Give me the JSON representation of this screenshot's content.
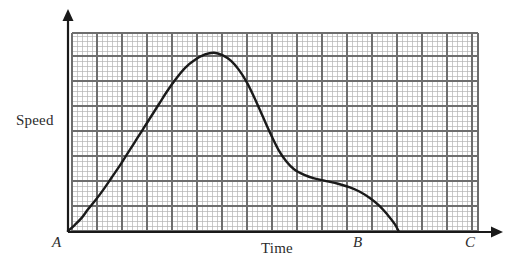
{
  "figure": {
    "kind": "speed-time-graph",
    "background_color": "#ffffff",
    "ink_color": "#1a1a1a"
  },
  "axes": {
    "x_axis_label": "Time",
    "y_axis_label": "Speed",
    "x_axis": {
      "start_x": 68,
      "end_x": 503,
      "y": 232,
      "arrow": true
    },
    "y_axis": {
      "x": 68,
      "top_y": 10,
      "bottom_y": 232,
      "arrow": true
    },
    "tick_labels": [
      {
        "name": "A",
        "text": "A",
        "x": 70,
        "y": 232
      },
      {
        "name": "B",
        "text": "B",
        "x": 360,
        "y": 232
      },
      {
        "name": "C",
        "text": "C",
        "x": 472,
        "y": 232
      }
    ]
  },
  "grid": {
    "left": 72,
    "top": 33,
    "right": 478,
    "bottom": 231,
    "minor_spacing": 5,
    "major_every": 5,
    "minor_color": "#b4b4b4",
    "major_color": "#6e6e6e"
  },
  "chart_data": {
    "type": "line",
    "title": "",
    "xlabel": "Time",
    "ylabel": "Speed",
    "grid": true,
    "legend": null,
    "x_tick_labels": [
      "A",
      "B",
      "C"
    ],
    "y_tick_labels": [],
    "annotations": [
      {
        "label": "A",
        "meaning": "origin / start of journey"
      },
      {
        "label": "B",
        "meaning": "speed returns to zero"
      },
      {
        "label": "C",
        "meaning": "end of time axis"
      }
    ],
    "series": [
      {
        "name": "Speed",
        "color": "#1a1a1a",
        "line_width": 2.4,
        "comment": "Speed rises from rest at A, peaks, falls to a plateau, then drops to rest at B.",
        "points": [
          {
            "x": 0.0,
            "y": 0.0
          },
          {
            "x": 0.035,
            "y": 0.035
          },
          {
            "x": 0.07,
            "y": 0.075
          },
          {
            "x": 0.1,
            "y": 0.12
          },
          {
            "x": 0.14,
            "y": 0.175
          },
          {
            "x": 0.18,
            "y": 0.235
          },
          {
            "x": 0.22,
            "y": 0.3
          },
          {
            "x": 0.26,
            "y": 0.365
          },
          {
            "x": 0.3,
            "y": 0.435
          },
          {
            "x": 0.34,
            "y": 0.505
          },
          {
            "x": 0.38,
            "y": 0.575
          },
          {
            "x": 0.42,
            "y": 0.645
          },
          {
            "x": 0.46,
            "y": 0.715
          },
          {
            "x": 0.5,
            "y": 0.785
          },
          {
            "x": 0.545,
            "y": 0.855
          },
          {
            "x": 0.59,
            "y": 0.915
          },
          {
            "x": 0.64,
            "y": 0.96
          },
          {
            "x": 0.69,
            "y": 0.99
          },
          {
            "x": 0.735,
            "y": 1.0
          },
          {
            "x": 0.78,
            "y": 0.985
          },
          {
            "x": 0.82,
            "y": 0.955
          },
          {
            "x": 0.86,
            "y": 0.905
          },
          {
            "x": 0.9,
            "y": 0.835
          },
          {
            "x": 0.94,
            "y": 0.745
          },
          {
            "x": 0.98,
            "y": 0.645
          },
          {
            "x": 1.02,
            "y": 0.545
          },
          {
            "x": 1.06,
            "y": 0.455
          },
          {
            "x": 1.1,
            "y": 0.39
          },
          {
            "x": 1.14,
            "y": 0.345
          },
          {
            "x": 1.19,
            "y": 0.315
          },
          {
            "x": 1.24,
            "y": 0.295
          },
          {
            "x": 1.3,
            "y": 0.28
          },
          {
            "x": 1.36,
            "y": 0.265
          },
          {
            "x": 1.42,
            "y": 0.245
          },
          {
            "x": 1.47,
            "y": 0.22
          },
          {
            "x": 1.52,
            "y": 0.185
          },
          {
            "x": 1.57,
            "y": 0.14
          },
          {
            "x": 1.61,
            "y": 0.09
          },
          {
            "x": 1.645,
            "y": 0.04
          },
          {
            "x": 1.665,
            "y": 0.0
          }
        ]
      }
    ],
    "xlim": [
      0,
      2.07
    ],
    "ylim": [
      0,
      1.06
    ]
  }
}
